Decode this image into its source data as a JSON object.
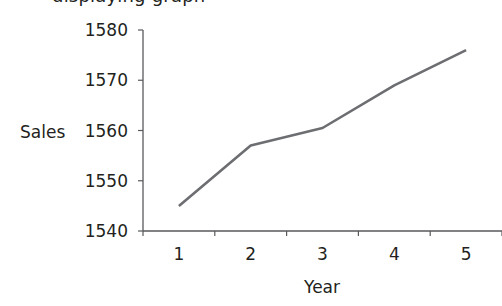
{
  "caption_fragment": "displaying graph",
  "chart_data": {
    "type": "line",
    "title": "",
    "xlabel": "Year",
    "ylabel": "Sales",
    "categories": [
      "1",
      "2",
      "3",
      "4",
      "5"
    ],
    "x": [
      1,
      2,
      3,
      4,
      5
    ],
    "series": [
      {
        "name": "Sales",
        "values": [
          1545,
          1557,
          1560.5,
          1569,
          1576
        ],
        "color": "#6d6e71"
      }
    ],
    "ylim": [
      1540,
      1580
    ],
    "yticks": [
      1540,
      1550,
      1560,
      1570,
      1580
    ],
    "ytick_labels": [
      "1540",
      "1550",
      "1560",
      "1570",
      "1580"
    ],
    "xtick_labels": [
      "1",
      "2",
      "3",
      "4",
      "5"
    ],
    "grid": false,
    "legend": "none",
    "axis_color": "#58595b",
    "text_color": "#231f20"
  }
}
